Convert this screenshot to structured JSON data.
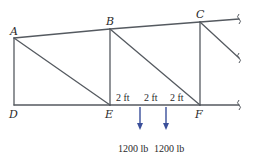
{
  "diagram": {
    "type": "truss",
    "colors": {
      "member": "#555a60",
      "load": "#3a4f9a",
      "text": "#2a2a2a",
      "background": "#ffffff"
    },
    "nodes": {
      "A": {
        "label": "A"
      },
      "B": {
        "label": "B"
      },
      "C": {
        "label": "C"
      },
      "D": {
        "label": "D"
      },
      "E": {
        "label": "E"
      },
      "F": {
        "label": "F"
      }
    },
    "members": [
      "AB",
      "BC",
      "AD",
      "AE",
      "BE",
      "BF",
      "CF",
      "DE",
      "EF"
    ],
    "continuations": [
      "top-chord-beyond-C",
      "diagonal-beyond-C",
      "bottom-chord-beyond-F"
    ],
    "dimensions": [
      {
        "label": "2 ft"
      },
      {
        "label": "2 ft"
      },
      {
        "label": "2 ft"
      }
    ],
    "loads": [
      {
        "label": "1200 lb",
        "direction": "down"
      },
      {
        "label": "1200 lb",
        "direction": "down"
      }
    ]
  }
}
